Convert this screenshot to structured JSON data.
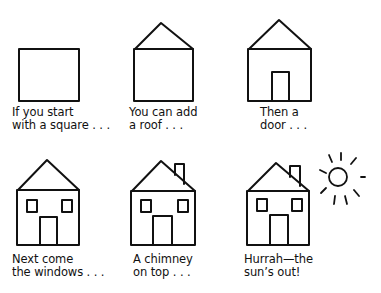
{
  "panels": [
    {
      "step": 1,
      "caption_line1": "If you start",
      "caption_line2": "with a square . . ."
    },
    {
      "step": 2,
      "caption_line1": "You can add",
      "caption_line2": "a roof . . ."
    },
    {
      "step": 3,
      "caption_line1": "Then a",
      "caption_line2": "door . . ."
    },
    {
      "step": 4,
      "caption_line1": "Next come",
      "caption_line2": "the windows . . ."
    },
    {
      "step": 5,
      "caption_line1": "A chimney",
      "caption_line2": "on top . . ."
    },
    {
      "step": 6,
      "caption_line1": "Hurrah—the",
      "caption_line2": "sun’s out!"
    }
  ],
  "colors": {
    "ink": "#111111",
    "background": "#ffffff"
  }
}
